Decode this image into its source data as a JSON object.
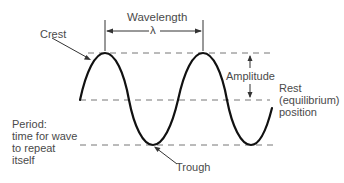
{
  "diagram": {
    "type": "wave-anatomy",
    "labels": {
      "wavelength": "Wavelength",
      "lambda": "λ",
      "crest": "Crest",
      "amplitude": "Amplitude",
      "rest_line1": "Rest",
      "rest_line2": "(equilibrium)",
      "rest_line3": "position",
      "period_line1": "Period:",
      "period_line2": "time for wave",
      "period_line3": "to repeat",
      "period_line4": "itself",
      "trough": "Trough"
    },
    "colors": {
      "wave": "#111111",
      "dashes": "#777777",
      "text": "#4a4a4a",
      "arrows": "#333333"
    }
  }
}
